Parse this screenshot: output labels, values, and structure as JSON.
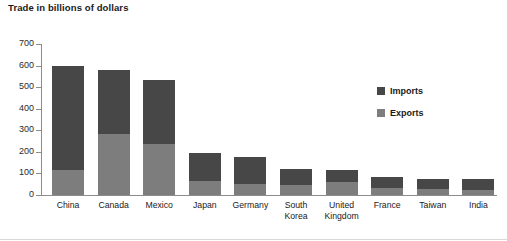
{
  "chart_data": {
    "type": "bar",
    "subtype": "stacked-vertical",
    "title": "Trade in billions of dollars",
    "xlabel": "",
    "ylabel": "",
    "ylim": [
      0,
      700
    ],
    "yticks": [
      0,
      100,
      200,
      300,
      400,
      500,
      600,
      700
    ],
    "ytick_labels": [
      "0",
      "100",
      "200",
      "300",
      "400",
      "500",
      "600",
      "700"
    ],
    "grid": false,
    "legend_position": "inside-right",
    "categories": [
      "China",
      "Canada",
      "Mexico",
      "Japan",
      "Germany",
      "South Korea",
      "United Kingdom",
      "France",
      "Taiwan",
      "India"
    ],
    "series": [
      {
        "name": "Exports",
        "color": "#7d7d7d",
        "values": [
          115,
          282,
          235,
          63,
          53,
          48,
          62,
          32,
          26,
          22
        ]
      },
      {
        "name": "Imports",
        "color": "#474747",
        "values": [
          483,
          296,
          298,
          134,
          125,
          72,
          56,
          50,
          49,
          53
        ]
      }
    ],
    "totals": [
      598,
      578,
      533,
      197,
      178,
      120,
      118,
      82,
      75,
      75
    ],
    "stack_order_bottom_to_top": [
      "Exports",
      "Imports"
    ]
  },
  "legend": {
    "items": [
      {
        "label": "Imports",
        "color": "#474747",
        "swatch": "legend-swatch-imports"
      },
      {
        "label": "Exports",
        "color": "#7d7d7d",
        "swatch": "legend-swatch-exports"
      }
    ]
  },
  "colors": {
    "imports": "#474747",
    "exports": "#7d7d7d",
    "axis": "#8c8c8c",
    "text": "#1a1a1a",
    "background": "#ffffff"
  }
}
